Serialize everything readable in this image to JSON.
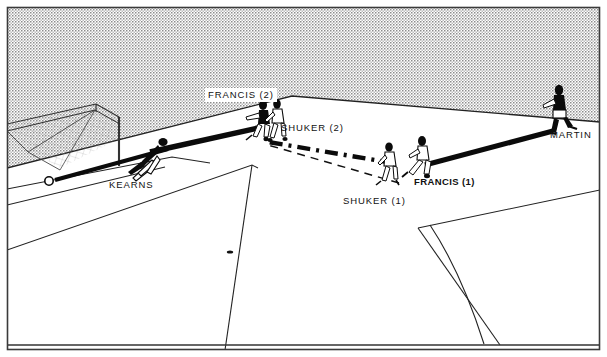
{
  "diagram": {
    "kind": "football-match-move-diagram",
    "title": "",
    "canvas": {
      "width": 607,
      "height": 357
    },
    "colors": {
      "ink": "#111111",
      "background": "#ffffff",
      "crowd_fill": "#d9d9d9",
      "pitch_fill": "#ffffff",
      "line": "#222222",
      "border": "#3a3a3a"
    },
    "labels": [
      {
        "id": "francis-2",
        "text": "FRANCIS (2)",
        "x": 205,
        "y": 88,
        "style": "boxed"
      },
      {
        "id": "shuker-2",
        "text": "SHUKER (2)",
        "x": 281,
        "y": 123,
        "style": "plain"
      },
      {
        "id": "martin",
        "text": "MARTIN",
        "x": 550,
        "y": 130,
        "style": "plain"
      },
      {
        "id": "kearns",
        "text": "KEARNS",
        "x": 109,
        "y": 180,
        "style": "plain"
      },
      {
        "id": "shuker-1",
        "text": "SHUKER (1)",
        "x": 343,
        "y": 196,
        "style": "plain"
      },
      {
        "id": "francis-1",
        "text": "FRANCIS (1)",
        "x": 414,
        "y": 177,
        "style": "bold"
      }
    ],
    "players": [
      {
        "id": "kearns",
        "name": "KEARNS",
        "kit": "dark",
        "pose": "diving-save",
        "x": 152,
        "y": 155
      },
      {
        "id": "francis-2",
        "name": "FRANCIS (2)",
        "kit": "dark",
        "pose": "striking",
        "x": 262,
        "y": 118
      },
      {
        "id": "shuker-2",
        "name": "SHUKER (2)",
        "kit": "light",
        "pose": "running",
        "x": 274,
        "y": 120
      },
      {
        "id": "shuker-1",
        "name": "SHUKER (1)",
        "kit": "light",
        "pose": "running",
        "x": 388,
        "y": 160
      },
      {
        "id": "francis-1",
        "name": "FRANCIS (1)",
        "kit": "light",
        "pose": "striking",
        "x": 419,
        "y": 157
      },
      {
        "id": "martin",
        "name": "MARTIN",
        "kit": "dark",
        "pose": "running",
        "x": 557,
        "y": 104
      }
    ],
    "ball": {
      "id": "ball-in-goal",
      "x": 49,
      "y": 180,
      "r": 4
    },
    "paths": [
      {
        "id": "pass-martin-to-francis1",
        "style": "solid-thick",
        "from": "MARTIN",
        "to": "FRANCIS (1)"
      },
      {
        "id": "shot-francis2-to-goal",
        "style": "solid-thick",
        "from": "FRANCIS (2)",
        "to": "GOAL"
      },
      {
        "id": "run-shuker",
        "style": "dash-dot",
        "from": "SHUKER (1)",
        "to": "SHUKER (2)"
      },
      {
        "id": "pass-ground",
        "style": "dashed-thin",
        "from": "SHUKER (1)",
        "to": "FRANCIS (2)"
      }
    ],
    "pitch_marks": [
      {
        "id": "penalty-spot"
      },
      {
        "id": "penalty-area"
      },
      {
        "id": "six-yard-box"
      },
      {
        "id": "centre-arc"
      },
      {
        "id": "goal-frame"
      },
      {
        "id": "touchline"
      },
      {
        "id": "goal-line"
      }
    ]
  }
}
